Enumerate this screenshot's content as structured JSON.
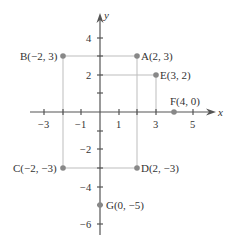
{
  "diagram": {
    "type": "coordinate-plane",
    "axes": {
      "x_label": "x",
      "y_label": "y"
    },
    "x_ticks": [
      {
        "value": -3,
        "label": "−3"
      },
      {
        "value": -1,
        "label": "−1"
      },
      {
        "value": 1,
        "label": "1"
      },
      {
        "value": 3,
        "label": "3"
      },
      {
        "value": 5,
        "label": "5"
      }
    ],
    "y_ticks": [
      {
        "value": 4,
        "label": "4"
      },
      {
        "value": 2,
        "label": "2"
      },
      {
        "value": -2,
        "label": "−2"
      },
      {
        "value": -4,
        "label": "−4"
      },
      {
        "value": -6,
        "label": "−6"
      }
    ],
    "points": [
      {
        "name": "A",
        "x": 2,
        "y": 3,
        "label": "A(2, 3)"
      },
      {
        "name": "B",
        "x": -2,
        "y": 3,
        "label": "B(−2, 3)"
      },
      {
        "name": "C",
        "x": -2,
        "y": -3,
        "label": "C(−2, −3)"
      },
      {
        "name": "D",
        "x": 2,
        "y": -3,
        "label": "D(2, −3)"
      },
      {
        "name": "E",
        "x": 3,
        "y": 2,
        "label": "E(3, 2)"
      },
      {
        "name": "F",
        "x": 4,
        "y": 0,
        "label": "F(4, 0)"
      },
      {
        "name": "G",
        "x": 0,
        "y": -5,
        "label": "G(0, −5)"
      }
    ],
    "colors": {
      "axis": "#555555",
      "guide": "#bbbbbb",
      "point": "#888888",
      "text": "#333333"
    }
  }
}
